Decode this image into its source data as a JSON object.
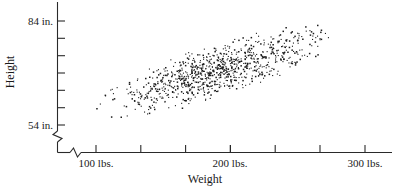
{
  "chart_data": {
    "type": "scatter",
    "title": "",
    "xlabel": "Weight",
    "ylabel": "Height",
    "x_unit": "lbs.",
    "y_unit": "in.",
    "xlim": [
      75,
      325
    ],
    "ylim": [
      54,
      90
    ],
    "grid": false,
    "legend": null,
    "axis_break_x": true,
    "axis_break_y": true,
    "x_tick_labels": [
      "100 lbs.",
      "200 lbs.",
      "300 lbs."
    ],
    "x_tick_values": [
      100,
      200,
      300
    ],
    "x_minor_tick_values": [
      125,
      150,
      175,
      225,
      250,
      275
    ],
    "y_tick_labels": [
      "54 in.",
      "84 in."
    ],
    "y_tick_values": [
      54,
      84
    ],
    "y_minor_tick_values": [
      59,
      64,
      69,
      74,
      79
    ],
    "n_points": 900,
    "correlation": 0.72,
    "cloud_shape": "elongated ellipse, positive slope",
    "point_color": "#1c1c1c"
  },
  "labels": {
    "y_axis_title": "Height",
    "x_axis_title": "Weight",
    "y_top": "84 in.",
    "y_bottom": "54 in.",
    "x_100": "100 lbs.",
    "x_200": "200 lbs.",
    "x_300": "300 lbs."
  }
}
